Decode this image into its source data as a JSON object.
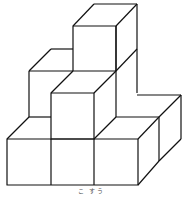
{
  "figure": {
    "type": "isometric-cube-stack",
    "stroke_color": "#111111",
    "background": "#ffffff"
  },
  "caption": {
    "text": "こ すう"
  }
}
